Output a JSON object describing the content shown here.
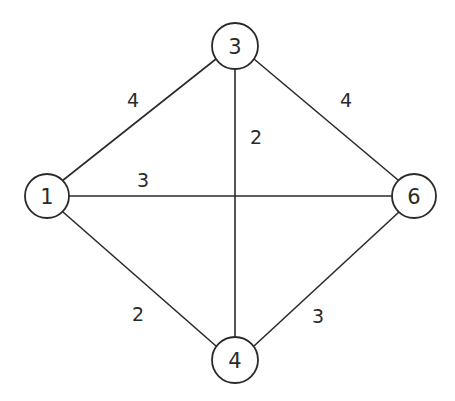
{
  "diagram": {
    "type": "weighted-undirected-graph",
    "nodes": [
      {
        "id": "1",
        "label": "1",
        "x": 47,
        "y": 196
      },
      {
        "id": "3",
        "label": "3",
        "x": 235,
        "y": 46
      },
      {
        "id": "6",
        "label": "6",
        "x": 414,
        "y": 196
      },
      {
        "id": "4",
        "label": "4",
        "x": 235,
        "y": 360
      }
    ],
    "edges": [
      {
        "from": "1",
        "to": "3",
        "weight": "4",
        "label_x": 133,
        "label_y": 100
      },
      {
        "from": "3",
        "to": "6",
        "weight": "4",
        "label_x": 346,
        "label_y": 100
      },
      {
        "from": "3",
        "to": "4",
        "weight": "2",
        "label_x": 256,
        "label_y": 137
      },
      {
        "from": "1",
        "to": "6",
        "weight": "3",
        "label_x": 143,
        "label_y": 180
      },
      {
        "from": "1",
        "to": "4",
        "weight": "2",
        "label_x": 138,
        "label_y": 314
      },
      {
        "from": "4",
        "to": "6",
        "weight": "3",
        "label_x": 318,
        "label_y": 316
      }
    ]
  }
}
